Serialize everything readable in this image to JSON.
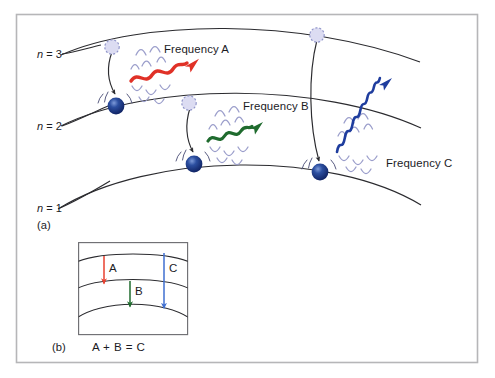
{
  "figure": {
    "type": "energy-level-transition-diagram",
    "width": 495,
    "height": 378,
    "panels": [
      {
        "id": "a",
        "label": "(a)"
      },
      {
        "id": "b",
        "label": "(b)"
      }
    ]
  },
  "colors": {
    "frequency_a": "#e03127",
    "frequency_b": "#1f6b2e",
    "frequency_c": "#1f3d9e",
    "inset_arrow_a": "#e8402f",
    "inset_arrow_b": "#1f6b2e",
    "inset_arrow_c": "#3f6fd0",
    "electron": "#17307d",
    "electron_highlight": "#5d7bc4",
    "excited_state": "#dcdcf2",
    "ripple": "#9b9ecb",
    "orbit_line": "#2b2b2f",
    "frame_outer": "#b6b6b8",
    "frame_inset": "#6f6f73",
    "text": "#1b1b1f",
    "background": "#ffffff"
  },
  "panel_a": {
    "panel_label": "(a)",
    "shell_labels": [
      {
        "id": "n3",
        "prefix": "n",
        "equals": " = ",
        "value": "3",
        "full": "n = 3"
      },
      {
        "id": "n2",
        "prefix": "n",
        "equals": " = ",
        "value": "2",
        "full": "n = 2"
      },
      {
        "id": "n1",
        "prefix": "n",
        "equals": " = ",
        "value": "1",
        "full": "n = 1"
      }
    ],
    "transitions": [
      {
        "id": "a",
        "label": "Frequency A",
        "from_shell": "3",
        "to_shell": "2",
        "color": "#e03127",
        "relative_frequency": "low",
        "wave_cycles": 3
      },
      {
        "id": "b",
        "label": "Frequency B",
        "from_shell": "2",
        "to_shell": "1",
        "color": "#1f6b2e",
        "relative_frequency": "medium",
        "wave_cycles": 4
      },
      {
        "id": "c",
        "label": "Frequency C",
        "from_shell": "3",
        "to_shell": "1",
        "color": "#1f3d9e",
        "relative_frequency": "high",
        "wave_cycles": 9
      }
    ]
  },
  "panel_b": {
    "panel_label": "(b)",
    "equation": "A + B = C",
    "arrows": [
      {
        "id": "a",
        "label": "A",
        "color": "#e8402f",
        "from_level": "3",
        "to_level": "2"
      },
      {
        "id": "b",
        "label": "B",
        "color": "#1f6b2e",
        "from_level": "2",
        "to_level": "1"
      },
      {
        "id": "c",
        "label": "C",
        "color": "#3f6fd0",
        "from_level": "3",
        "to_level": "1"
      }
    ]
  }
}
